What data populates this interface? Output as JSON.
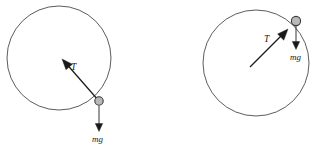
{
  "figure": {
    "background_color": "#ffffff",
    "circle_stroke_color": "#4a4a4a",
    "bob_fill_color": "#b9b9b9",
    "bob_stroke_color": "#3a3a3a",
    "vector_color": "#1a1a1a",
    "label_color": "#1a1a1a"
  },
  "diagrams": [
    {
      "id": "left-diagram",
      "name": "ball-at-bottom-right-of-circle",
      "circle": {
        "cx": 59,
        "cy": 58,
        "r": 52
      },
      "bob": {
        "cx": 99,
        "cy": 101,
        "r": 4.2
      },
      "vectors": [
        {
          "id": "tension",
          "label": "T",
          "label_x": 71,
          "label_y": 70,
          "tail_x": 99,
          "tail_y": 101,
          "tip_x": 62,
          "tip_y": 59,
          "head_at": "tip",
          "description": "tension points from the ball toward the circle center (up and to the left)"
        },
        {
          "id": "weight",
          "label": "mg",
          "label_x": 92,
          "label_y": 142,
          "tail_x": 99,
          "tail_y": 106,
          "tip_x": 99,
          "tip_y": 131,
          "head_at": "tip",
          "description": "weight points straight down from the ball"
        }
      ]
    },
    {
      "id": "right-diagram",
      "name": "ball-at-upper-right-of-circle",
      "circle": {
        "cx": 256,
        "cy": 63,
        "r": 53
      },
      "bob": {
        "cx": 296,
        "cy": 21,
        "r": 4.6
      },
      "vectors": [
        {
          "id": "tension",
          "label": "T",
          "label_x": 264,
          "label_y": 42,
          "tail_x": 250,
          "tail_y": 67,
          "tip_x": 288,
          "tip_y": 29,
          "head_at": "tip",
          "description": "tension points from lower-left up toward the ball (toward circle center direction reversed)"
        },
        {
          "id": "weight",
          "label": "mg",
          "label_x": 290,
          "label_y": 60,
          "tail_x": 296,
          "tail_y": 26,
          "tip_x": 296,
          "tip_y": 49,
          "head_at": "tip",
          "description": "weight points straight down from the ball"
        }
      ]
    }
  ],
  "labels": {
    "tension_symbol": "T",
    "weight_symbol": "mg"
  }
}
